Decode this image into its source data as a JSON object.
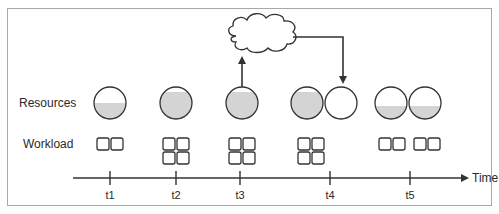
{
  "diagram": {
    "row_labels": {
      "resources": "Resources",
      "workload": "Workload"
    },
    "axis": {
      "label": "Time",
      "ticks": [
        "t1",
        "t2",
        "t3",
        "t4",
        "t5"
      ]
    },
    "colors": {
      "stroke": "#333333",
      "fill": "#d4d4d4",
      "frame": "#a8a8a8"
    },
    "time_points": [
      {
        "tick": "t1",
        "resources": [
          0.5
        ],
        "workload_units": 2
      },
      {
        "tick": "t2",
        "resources": [
          0.85
        ],
        "workload_units": 4
      },
      {
        "tick": "t3",
        "resources": [
          0.85
        ],
        "workload_units": 4,
        "scale_request": "up-to-cloud"
      },
      {
        "tick": "t4",
        "resources": [
          0.85,
          0.0
        ],
        "workload_units": 4,
        "scale_response": "new-resource-from-cloud"
      },
      {
        "tick": "t5",
        "resources": [
          0.45,
          0.45
        ],
        "workload_units": 4
      }
    ],
    "cloud": {
      "name": "cloud"
    }
  }
}
